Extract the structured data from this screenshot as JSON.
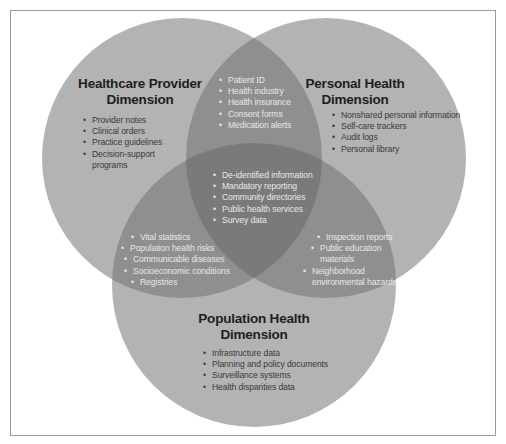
{
  "colors": {
    "single": "#b3b3b3",
    "pair": "#8f8f8f",
    "center": "#7a7a7a",
    "frame_border": "#9a9a9a",
    "dark_text": "#1e1e1e",
    "light_text": "#e8e8e8"
  },
  "circles": {
    "healthcare_provider": {
      "title_line1": "Healthcare Provider",
      "title_line2": "Dimension",
      "items": [
        "Provider notes",
        "Clinical orders",
        "Practice guidelines",
        "Decision-support",
        "programs"
      ]
    },
    "personal_health": {
      "title_line1": "Personal Health",
      "title_line2": "Dimension",
      "items": [
        "Nonshared personal information",
        "Self-care trackers",
        "Audit logs",
        "Personal library"
      ]
    },
    "population_health": {
      "title_line1": "Population Health",
      "title_line2": "Dimension",
      "items": [
        "Infrastructure data",
        "Planning and policy documents",
        "Surveillance systems",
        "Health disparities data"
      ]
    }
  },
  "overlaps": {
    "provider_personal": {
      "items": [
        "Patient ID",
        "Health industry",
        "Health insurance",
        "Consent forms",
        "Medication alerts"
      ]
    },
    "provider_population": {
      "items": [
        "Vital statistics",
        "Population health risks",
        "Communicable diseases",
        "Socioeconomic conditions",
        "Registries"
      ]
    },
    "personal_population": {
      "items": [
        "Inspection reports",
        "Public education",
        "materials",
        "Neighborhood",
        "environmental hazards"
      ]
    },
    "all_three": {
      "items": [
        "De-identified information",
        "Mandatory reporting",
        "Community directories",
        "Public health services",
        "Survey data"
      ]
    }
  }
}
